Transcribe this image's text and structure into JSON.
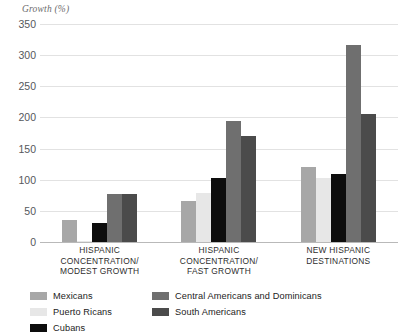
{
  "chart_data": {
    "type": "bar",
    "title": "",
    "subtitle": "",
    "ylabel": "Growth (%)",
    "xlabel": "",
    "ylim": [
      0,
      350
    ],
    "yticks": [
      0,
      50,
      100,
      150,
      200,
      250,
      300,
      350
    ],
    "ytick_labels": [
      "0",
      "50",
      "100",
      "150",
      "200",
      "250",
      "300",
      "350"
    ],
    "grid": true,
    "legend_position": "bottom-left",
    "categories": [
      "HISPANIC CONCENTRATION/ MODEST GROWTH",
      "HISPANIC CONCENTRATION/ FAST GROWTH",
      "NEW HISPANIC DESTINATIONS"
    ],
    "category_lines": [
      [
        "HISPANIC",
        "CONCENTRATION/",
        "MODEST GROWTH"
      ],
      [
        "HISPANIC",
        "CONCENTRATION/",
        "FAST GROWTH"
      ],
      [
        "NEW HISPANIC",
        "DESTINATIONS"
      ]
    ],
    "series": [
      {
        "name": "Mexicans",
        "color": "#a7a7a7",
        "values": [
          36,
          66,
          120
        ]
      },
      {
        "name": "Puerto Ricans",
        "color": "#e7e7e7",
        "values": [
          2,
          78,
          102
        ]
      },
      {
        "name": "Cubans",
        "color": "#0d0d0d",
        "values": [
          30,
          103,
          110
        ]
      },
      {
        "name": "Central Americans and Dominicans",
        "color": "#6f6f6f",
        "values": [
          77,
          195,
          317
        ]
      },
      {
        "name": "South Americans",
        "color": "#4b4b4b",
        "values": [
          77,
          170,
          205
        ]
      }
    ]
  },
  "legend": {
    "columns": [
      [
        "Mexicans",
        "Puerto Ricans",
        "Cubans"
      ],
      [
        "Central Americans and Dominicans",
        "South Americans"
      ]
    ]
  }
}
